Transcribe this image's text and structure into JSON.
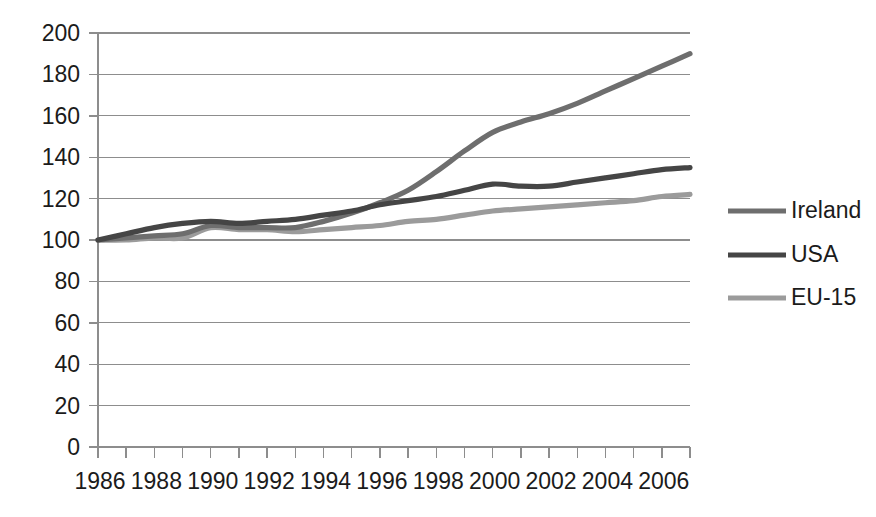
{
  "chart_data": {
    "type": "line",
    "title": "",
    "subtitle": "",
    "xlabel": "",
    "ylabel": "",
    "xlim": [
      1986,
      2007
    ],
    "ylim": [
      0,
      200
    ],
    "grid": true,
    "legend_position": "right",
    "x": [
      1986,
      1987,
      1988,
      1989,
      1990,
      1991,
      1992,
      1993,
      1994,
      1995,
      1996,
      1997,
      1998,
      1999,
      2000,
      2001,
      2002,
      2003,
      2004,
      2005,
      2006,
      2007
    ],
    "series": [
      {
        "name": "Ireland",
        "color": "#6e6e6e",
        "values": [
          100,
          101,
          102,
          103,
          107,
          106,
          106,
          106,
          109,
          113,
          118,
          124,
          133,
          143,
          152,
          157,
          161,
          166,
          172,
          178,
          184,
          190
        ]
      },
      {
        "name": "USA",
        "color": "#454545",
        "values": [
          100,
          103,
          106,
          108,
          109,
          108,
          109,
          110,
          112,
          114,
          117,
          119,
          121,
          124,
          127,
          126,
          126,
          128,
          130,
          132,
          134,
          135
        ]
      },
      {
        "name": "EU-15",
        "color": "#9b9b9b",
        "values": [
          100,
          100,
          101,
          101,
          106,
          105,
          105,
          104,
          105,
          106,
          107,
          109,
          110,
          112,
          114,
          115,
          116,
          117,
          118,
          119,
          121,
          122
        ]
      }
    ],
    "y_ticks": [
      0,
      20,
      40,
      60,
      80,
      100,
      120,
      140,
      160,
      180,
      200
    ],
    "x_tick_labels": [
      "1986",
      "1988",
      "1990",
      "1992",
      "1994",
      "1996",
      "1998",
      "2000",
      "2002",
      "2004",
      "2006"
    ],
    "x_tick_label_years": [
      1986,
      1988,
      1990,
      1992,
      1994,
      1996,
      1998,
      2000,
      2002,
      2004,
      2006
    ],
    "x_minor_tick_years": [
      1986,
      1987,
      1988,
      1989,
      1990,
      1991,
      1992,
      1993,
      1994,
      1995,
      1996,
      1997,
      1998,
      1999,
      2000,
      2001,
      2002,
      2003,
      2004,
      2005,
      2006,
      2007
    ],
    "legend": [
      {
        "label": "Ireland",
        "color": "#6e6e6e"
      },
      {
        "label": "USA",
        "color": "#454545"
      },
      {
        "label": "EU-15",
        "color": "#9b9b9b"
      }
    ]
  },
  "plot_geometry": {
    "left": 98,
    "right": 690,
    "top": 33,
    "bottom": 447,
    "legend_line_x1": 728,
    "legend_line_x2": 786,
    "legend_text_x": 791,
    "legend_y": [
      211,
      255,
      298
    ]
  }
}
